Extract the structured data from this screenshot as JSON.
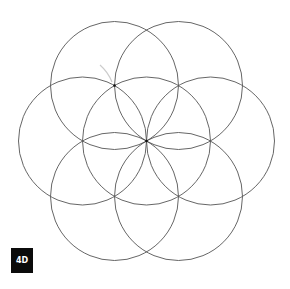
{
  "diagram": {
    "stroke_color": "#555555",
    "point_color": "#111111",
    "guide_color": "#cccccc",
    "radius": 64,
    "circles": [
      {
        "cx": 146.5,
        "cy": 141
      },
      {
        "cx": 114.5,
        "cy": 85.5
      },
      {
        "cx": 178.5,
        "cy": 85.5
      },
      {
        "cx": 82.5,
        "cy": 141
      },
      {
        "cx": 210.5,
        "cy": 141
      },
      {
        "cx": 114.5,
        "cy": 196.5
      },
      {
        "cx": 178.5,
        "cy": 196.5
      }
    ],
    "points": [
      {
        "x": 146.5,
        "y": 141
      },
      {
        "x": 114.5,
        "y": 85.5
      }
    ]
  },
  "badge": {
    "label": "4D",
    "bg": "#0b0b0b",
    "fg": "#ffffff"
  }
}
